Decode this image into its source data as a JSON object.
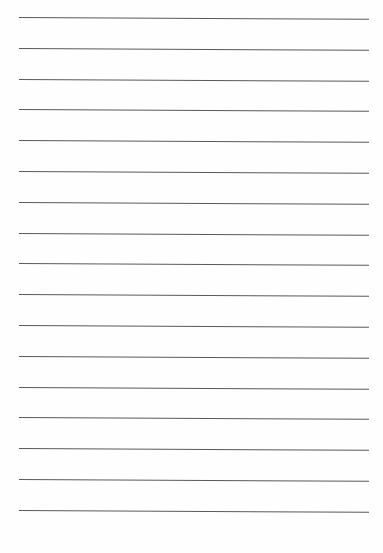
{
  "sheet": {
    "type": "lined-paper",
    "line_count": 17,
    "line_color": "#5a5a5a",
    "background": "#fefefe",
    "first_line_y": 17,
    "line_spacing": 30.8,
    "line_left_x": 19,
    "line_width": 350
  }
}
